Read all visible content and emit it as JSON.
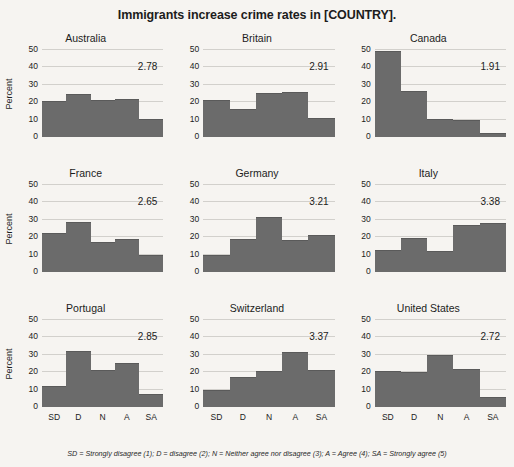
{
  "chart_data": {
    "type": "bar",
    "title": "Immigrants increase crime rates in [COUNTRY].",
    "xlabel": "",
    "ylabel": "Percent",
    "ylim": [
      0,
      50
    ],
    "yticks": [
      0,
      10,
      20,
      30,
      40,
      50
    ],
    "grid": true,
    "legend_position": "none",
    "categories": [
      "SD",
      "D",
      "N",
      "A",
      "SA"
    ],
    "category_definitions": "SD = Strongly disagree (1); D = disagree (2); N = Neither agree nor disagree (3); A = Agree (4); SA = Strongly agree (5)",
    "panel_layout": {
      "rows": 3,
      "cols": 3
    },
    "panels": [
      {
        "title": "Australia",
        "values": [
          20.5,
          25.0,
          21.0,
          22.0,
          10.5
        ],
        "mean": "2.78",
        "show_ylabel": true,
        "show_xlabels": false
      },
      {
        "title": "Britain",
        "values": [
          21.0,
          16.0,
          25.5,
          26.0,
          11.0
        ],
        "mean": "2.91",
        "show_ylabel": false,
        "show_xlabels": false
      },
      {
        "title": "Canada",
        "values": [
          49.5,
          26.5,
          10.5,
          10.0,
          2.5
        ],
        "mean": "1.91",
        "show_ylabel": false,
        "show_xlabels": false
      },
      {
        "title": "France",
        "values": [
          22.5,
          29.0,
          17.0,
          19.0,
          10.0
        ],
        "mean": "2.65",
        "show_ylabel": true,
        "show_xlabels": false
      },
      {
        "title": "Germany",
        "values": [
          10.0,
          19.0,
          31.5,
          18.5,
          21.0
        ],
        "mean": "3.21",
        "show_ylabel": false,
        "show_xlabels": false
      },
      {
        "title": "Italy",
        "values": [
          12.5,
          19.5,
          12.0,
          27.0,
          28.0
        ],
        "mean": "3.38",
        "show_ylabel": false,
        "show_xlabels": false
      },
      {
        "title": "Portugal",
        "values": [
          12.0,
          32.0,
          21.5,
          25.5,
          7.5
        ],
        "mean": "2.85",
        "show_ylabel": true,
        "show_xlabels": true
      },
      {
        "title": "Switzerland",
        "values": [
          10.0,
          17.5,
          20.5,
          31.5,
          21.0
        ],
        "mean": "3.37",
        "show_ylabel": false,
        "show_xlabels": true
      },
      {
        "title": "United States",
        "values": [
          20.5,
          20.0,
          30.0,
          22.0,
          5.5
        ],
        "mean": "2.72",
        "show_ylabel": false,
        "show_xlabels": true
      }
    ]
  },
  "colors": {
    "bar_fill": "#6b6b6b",
    "gridline": "#d2d0cc",
    "axis_line": "#8c8a86",
    "background": "#f6f4f1",
    "text": "#1c1c1c"
  },
  "footnote": "SD = Strongly disagree (1); D = disagree (2); N = Neither agree nor disagree (3); A = Agree (4); SA = Strongly agree (5)"
}
